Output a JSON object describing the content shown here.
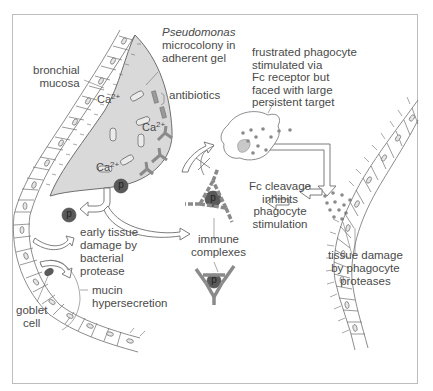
{
  "figure": {
    "type": "biological diagram"
  },
  "labels": {
    "bronchial_mucosa": "bronchial\nmucosa",
    "pseudomonas_italic": "Pseudomonas",
    "microcolony": "microcolony in\nadherent gel",
    "antibiotics": "antibiotics",
    "frustrated_phagocyte": "frustrated phagocyte\nstimulated via\nFc receptor but\nfaced with large\npersistent target",
    "fc_cleavage": "Fc cleavage\ninhibits\nphagocyte\nstimulation",
    "immune_complexes": "immune\ncomplexes",
    "early_tissue_damage": "early tissue\ndamage by\nbacterial\nprotease",
    "mucin_hypersecretion": "mucin\nhypersecretion",
    "goblet_cell": "goblet\ncell",
    "tissue_damage_phagocyte": "tissue damage\nby phagocyte\nproteases"
  },
  "ions": [
    {
      "base": "Ca",
      "charge": "2+"
    },
    {
      "base": "Ca",
      "charge": "2+"
    },
    {
      "base": "Ca",
      "charge": "2+"
    }
  ],
  "protease_symbol": "p",
  "colors": {
    "gel_fill": "#d9d9d9",
    "outline": "#6e6e6e",
    "protease": "#5a5a5a",
    "antibody": "#9a9a9a",
    "frame": "#bdbdbd",
    "text": "#4a4a4a"
  }
}
